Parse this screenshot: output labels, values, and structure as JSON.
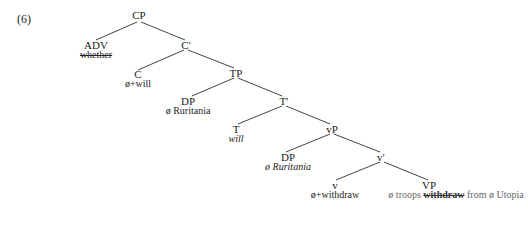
{
  "example_number": "(6)",
  "tree": {
    "CP": {
      "label": "CP"
    },
    "ADV": {
      "label": "ADV",
      "word": "whether",
      "word_style": "strikethrough"
    },
    "Cbar": {
      "label": "C′"
    },
    "C": {
      "label": "C",
      "word": "ø+will"
    },
    "TP": {
      "label": "TP"
    },
    "DP1": {
      "label": "DP",
      "word": "ø Ruritania"
    },
    "Tbar": {
      "label": "T′"
    },
    "T": {
      "label": "T",
      "word": "will",
      "word_style": "italic"
    },
    "vP": {
      "label": "vP"
    },
    "DP2": {
      "label": "DP",
      "word": "ø Ruritania",
      "word_style": "italic"
    },
    "vbar": {
      "label": "v′"
    },
    "v": {
      "label": "v",
      "word": "ø+withdraw"
    },
    "VP": {
      "label": "VP",
      "word_parts": [
        "ø troops ",
        "withdraw",
        " from ø  Utopia"
      ],
      "word_style": "grey, 'withdraw' struck through"
    }
  },
  "edges": [
    [
      "CP",
      "ADV"
    ],
    [
      "CP",
      "Cbar"
    ],
    [
      "Cbar",
      "C"
    ],
    [
      "Cbar",
      "TP"
    ],
    [
      "TP",
      "DP1"
    ],
    [
      "TP",
      "Tbar"
    ],
    [
      "Tbar",
      "T"
    ],
    [
      "Tbar",
      "vP"
    ],
    [
      "vP",
      "DP2"
    ],
    [
      "vP",
      "vbar"
    ],
    [
      "vbar",
      "v"
    ],
    [
      "vbar",
      "VP"
    ]
  ]
}
